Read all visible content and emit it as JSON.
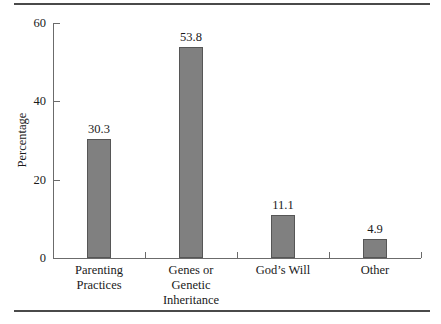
{
  "chart_data": {
    "type": "bar",
    "title": "",
    "xlabel": "",
    "ylabel": "Percentage",
    "ylim": [
      0,
      60
    ],
    "yticks": [
      0,
      20,
      40,
      60
    ],
    "ytick_labels": [
      "0",
      "20",
      "40",
      "60"
    ],
    "grid": false,
    "legend": "none",
    "categories": [
      "Parenting Practices",
      "Genes or Genetic Inheritance",
      "God’s Will",
      "Other"
    ],
    "category_lines": [
      [
        "Parenting",
        "Practices"
      ],
      [
        "Genes or",
        "Genetic",
        "Inheritance"
      ],
      [
        "God’s Will"
      ],
      [
        "Other"
      ]
    ],
    "values": [
      30.3,
      53.8,
      11.1,
      4.9
    ],
    "value_labels": [
      "30.3",
      "53.8",
      "11.1",
      "4.9"
    ],
    "bar_color": "#808080",
    "bar_edge_color": "#565656",
    "axis_color": "#6b6b6b",
    "rule_color": "#4a4a4a",
    "background": "#ffffff"
  }
}
